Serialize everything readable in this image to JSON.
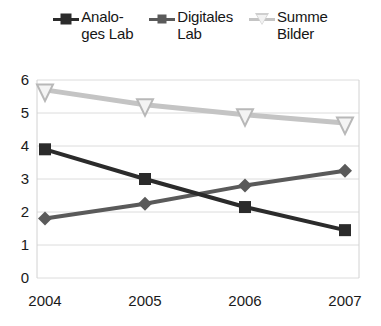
{
  "chart_data": {
    "type": "line",
    "title": "",
    "xlabel": "",
    "ylabel": "",
    "categories": [
      "2004",
      "2005",
      "2006",
      "2007"
    ],
    "ylim": [
      0,
      6
    ],
    "y_ticks": [
      "0",
      "1",
      "2",
      "3",
      "4",
      "5",
      "6"
    ],
    "grid": true,
    "legend_position": "top",
    "series": [
      {
        "name": "Analoges Lab",
        "legend_label": "Analo-\nges Lab",
        "marker": "square",
        "color": "#2b2b2b",
        "values": [
          3.9,
          3.0,
          2.15,
          1.45
        ]
      },
      {
        "name": "Digitales Lab",
        "legend_label": "Digitales\nLab",
        "marker": "diamond",
        "color": "#5a5a5a",
        "values": [
          1.8,
          2.25,
          2.8,
          3.25
        ]
      },
      {
        "name": "Summe Bilder",
        "legend_label": "Summe\nBilder",
        "marker": "triangle-down",
        "color": "#c4c4c4",
        "values": [
          5.7,
          5.25,
          4.95,
          4.7
        ]
      }
    ]
  },
  "legend": {
    "entries": [
      {
        "label": "Analo-\nges Lab",
        "marker_name": "square-marker-icon"
      },
      {
        "label": "Digitales\nLab",
        "marker_name": "diamond-marker-icon"
      },
      {
        "label": "Summe\nBilder",
        "marker_name": "triangle-marker-icon"
      }
    ]
  },
  "axes": {
    "y_ticks": [
      "6",
      "5",
      "4",
      "3",
      "2",
      "1",
      "0"
    ],
    "x_ticks": [
      "2004",
      "2005",
      "2006",
      "2007"
    ]
  },
  "colors": {
    "series_analog": "#2b2b2b",
    "series_digital": "#5a5a5a",
    "series_summe": "#c4c4c4",
    "grid": "#dcdcdc",
    "frame": "#d2d2d2",
    "text": "#1a1a1a",
    "background": "#ffffff"
  }
}
